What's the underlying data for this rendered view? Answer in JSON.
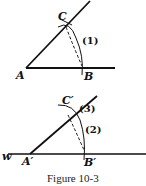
{
  "figure": {
    "caption": "Figure 10-3",
    "top": {
      "points": {
        "A": "A",
        "B": "B",
        "C": "C"
      },
      "step_labels": [
        "(1)"
      ]
    },
    "bottom": {
      "line_label": "w",
      "points": {
        "A": "A′",
        "B": "B′",
        "C": "C′"
      },
      "step_labels": [
        "(2)",
        "(3)"
      ]
    },
    "colors": {
      "ink": "#111111",
      "background": "#ffffff"
    }
  }
}
